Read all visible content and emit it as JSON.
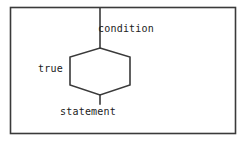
{
  "diagram": {
    "type": "syntax-railroad-diagram",
    "frame": {
      "name": "figure-border",
      "stroke_color": "#3a3a3a",
      "background_color": "#ffffff",
      "x": 10,
      "y": 7,
      "width": 226,
      "height": 127
    },
    "shapes": {
      "hexagon": {
        "name": "decision-hexagon",
        "stroke_color": "#3a3a3a",
        "points": "100,48 130,57 130,85 100,95 70,85 70,57"
      },
      "top_stem": {
        "name": "condition-entry-line",
        "x": 100,
        "y1": 8,
        "y2": 48
      },
      "bottom_stem": {
        "name": "statement-exit-line",
        "x": 100,
        "y1": 95,
        "y2": 104
      }
    },
    "labels": [
      {
        "id": "condition",
        "text": "condition",
        "x": 98,
        "y": 24
      },
      {
        "id": "true",
        "text": "true",
        "x": 38,
        "y": 64
      },
      {
        "id": "statement",
        "text": "statement",
        "x": 60,
        "y": 107
      }
    ],
    "stroke_color": "#3a3a3a",
    "text_color": "#1b1b1b",
    "background_color": "#ffffff"
  }
}
